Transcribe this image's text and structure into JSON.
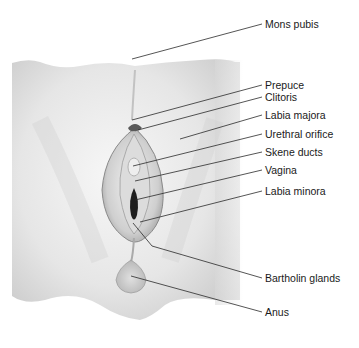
{
  "diagram": {
    "type": "anatomical-illustration",
    "labels": [
      {
        "id": "mons-pubis",
        "text": "Mons pubis",
        "x": 265,
        "y": 21,
        "target": [
          132,
          59
        ]
      },
      {
        "id": "prepuce",
        "text": "Prepuce",
        "x": 265,
        "y": 82,
        "target": [
          132,
          120
        ]
      },
      {
        "id": "clitoris",
        "text": "Clitoris",
        "x": 265,
        "y": 94,
        "target": [
          138,
          130
        ]
      },
      {
        "id": "labia-majora",
        "text": "Labia majora",
        "x": 265,
        "y": 112,
        "target": [
          180,
          139
        ]
      },
      {
        "id": "urethral-orifice",
        "text": "Urethral orifice",
        "x": 265,
        "y": 131,
        "target": [
          133,
          166
        ]
      },
      {
        "id": "skene-ducts",
        "text": "Skene ducts",
        "x": 265,
        "y": 149,
        "target": [
          135,
          181
        ]
      },
      {
        "id": "vagina",
        "text": "Vagina",
        "x": 265,
        "y": 167,
        "target": [
          135,
          200
        ]
      },
      {
        "id": "labia-minora",
        "text": "Labia minora",
        "x": 265,
        "y": 188,
        "target": [
          140,
          222
        ]
      },
      {
        "id": "bartholin-glands",
        "text": "Bartholin glands",
        "x": 265,
        "y": 275,
        "target": [
          133,
          223
        ]
      },
      {
        "id": "anus",
        "text": "Anus",
        "x": 265,
        "y": 309,
        "target": [
          131,
          276
        ]
      }
    ]
  }
}
